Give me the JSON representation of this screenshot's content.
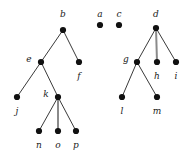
{
  "figure": {
    "width": 189,
    "height": 154,
    "background_color": "#ffffff",
    "node_color": "#111111",
    "node_radius": 3.1,
    "edge_color": "#3a3a3a",
    "edge_color_thick": "#8a8a8a",
    "edge_width": 1,
    "edge_width_thick": 2,
    "label_color": "#1a1a1a",
    "label_style": "italic-serif",
    "label_font_size": 9
  },
  "nodes": [
    {
      "id": "b",
      "label": "b",
      "x": 63,
      "y": 30,
      "label_x": 63,
      "label_y": 14,
      "label_pos": "above"
    },
    {
      "id": "a",
      "label": "a",
      "x": 100,
      "y": 25,
      "label_x": 100,
      "label_y": 14,
      "label_pos": "above"
    },
    {
      "id": "c",
      "label": "c",
      "x": 119,
      "y": 25,
      "label_x": 119,
      "label_y": 14,
      "label_pos": "above"
    },
    {
      "id": "d",
      "label": "d",
      "x": 156,
      "y": 28,
      "label_x": 156,
      "label_y": 14,
      "label_pos": "above"
    },
    {
      "id": "e",
      "label": "e",
      "x": 41,
      "y": 62,
      "label_x": 29,
      "label_y": 59,
      "label_pos": "left"
    },
    {
      "id": "f",
      "label": "f",
      "x": 79,
      "y": 62,
      "label_x": 79,
      "label_y": 76,
      "label_pos": "below"
    },
    {
      "id": "g",
      "label": "g",
      "x": 137,
      "y": 62,
      "label_x": 126,
      "label_y": 59,
      "label_pos": "left"
    },
    {
      "id": "h",
      "label": "h",
      "x": 157,
      "y": 62,
      "label_x": 157,
      "label_y": 76,
      "label_pos": "below"
    },
    {
      "id": "i",
      "label": "i",
      "x": 176,
      "y": 62,
      "label_x": 176,
      "label_y": 76,
      "label_pos": "below"
    },
    {
      "id": "j",
      "label": "j",
      "x": 17,
      "y": 97,
      "label_x": 17,
      "label_y": 111,
      "label_pos": "below"
    },
    {
      "id": "k",
      "label": "k",
      "x": 58,
      "y": 97,
      "label_x": 46,
      "label_y": 94,
      "label_pos": "left"
    },
    {
      "id": "l",
      "label": "l",
      "x": 122,
      "y": 97,
      "label_x": 122,
      "label_y": 111,
      "label_pos": "below"
    },
    {
      "id": "m",
      "label": "m",
      "x": 157,
      "y": 97,
      "label_x": 157,
      "label_y": 111,
      "label_pos": "below"
    },
    {
      "id": "n",
      "label": "n",
      "x": 39,
      "y": 131,
      "label_x": 39,
      "label_y": 145,
      "label_pos": "below"
    },
    {
      "id": "o",
      "label": "o",
      "x": 58,
      "y": 131,
      "label_x": 58,
      "label_y": 145,
      "label_pos": "below"
    },
    {
      "id": "p",
      "label": "p",
      "x": 76,
      "y": 131,
      "label_x": 76,
      "label_y": 145,
      "label_pos": "below"
    }
  ],
  "edges": [
    {
      "from": "b",
      "to": "e",
      "style": "thin"
    },
    {
      "from": "b",
      "to": "f",
      "style": "thin"
    },
    {
      "from": "e",
      "to": "j",
      "style": "thin"
    },
    {
      "from": "e",
      "to": "k",
      "style": "thin"
    },
    {
      "from": "k",
      "to": "n",
      "style": "thin"
    },
    {
      "from": "k",
      "to": "o",
      "style": "thick"
    },
    {
      "from": "k",
      "to": "p",
      "style": "thin"
    },
    {
      "from": "d",
      "to": "g",
      "style": "thin"
    },
    {
      "from": "d",
      "to": "h",
      "style": "thick"
    },
    {
      "from": "d",
      "to": "i",
      "style": "thin"
    },
    {
      "from": "g",
      "to": "l",
      "style": "thin"
    },
    {
      "from": "g",
      "to": "m",
      "style": "thin"
    }
  ],
  "components": [
    {
      "root": "b",
      "members": [
        "b",
        "e",
        "f",
        "j",
        "k",
        "n",
        "o",
        "p"
      ]
    },
    {
      "root": "a",
      "members": [
        "a"
      ]
    },
    {
      "root": "c",
      "members": [
        "c"
      ]
    },
    {
      "root": "d",
      "members": [
        "d",
        "g",
        "h",
        "i",
        "l",
        "m"
      ]
    }
  ]
}
